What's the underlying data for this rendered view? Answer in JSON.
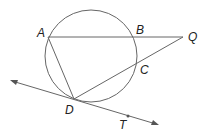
{
  "diagram": {
    "labels": {
      "A": "A",
      "B": "B",
      "Q": "Q",
      "C": "C",
      "D": "D",
      "T": "T"
    },
    "stroke_color": "#555555"
  }
}
